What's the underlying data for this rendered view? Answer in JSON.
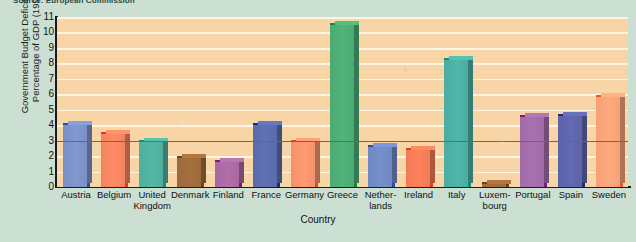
{
  "source_note": "Source: European Commission",
  "axis": {
    "y_title": "Government Budget Deficit\nas a Percentage of GDP (1996)",
    "x_title": "Country"
  },
  "chart_data": {
    "type": "bar",
    "title": "",
    "xlabel": "Country",
    "ylabel": "Government Budget Deficit as a Percentage of GDP (1996)",
    "ylim": [
      0,
      11
    ],
    "yticks": [
      0,
      1,
      2,
      3,
      4,
      5,
      6,
      7,
      8,
      9,
      10,
      11
    ],
    "grid": true,
    "legend": "none",
    "reference_line": {
      "value": 3.0,
      "color": "#e23a22",
      "label": ""
    },
    "categories": [
      "Austria",
      "Belgium",
      "United\nKingdom",
      "Denmark",
      "Finland",
      "France",
      "Germany",
      "Greece",
      "Nether-\nlands",
      "Ireland",
      "Italy",
      "Luxem-\nbourg",
      "Portugal",
      "Spain",
      "Sweden"
    ],
    "values": [
      4.0,
      3.4,
      2.9,
      1.9,
      1.6,
      4.0,
      2.9,
      10.5,
      2.6,
      2.4,
      8.2,
      0.1,
      4.5,
      4.6,
      5.8
    ],
    "bar_colors": [
      "#7b8fc4",
      "#f2835f",
      "#4fae9c",
      "#9d6a3b",
      "#a868a0",
      "#5a6bab",
      "#f2916c",
      "#4caa72",
      "#6f88c2",
      "#f07a56",
      "#4aada0",
      "#9d6a3b",
      "#a06ba6",
      "#5d63a8",
      "#f5a077"
    ],
    "bar_edge_colors": [
      "#2b4fa0",
      "#e23a22",
      "#0f8f79",
      "#6b4318",
      "#7a1d76",
      "#1b2a7a",
      "#e04a22",
      "#0f8a42",
      "#2b4fa0",
      "#e23a22",
      "#0f8f79",
      "#6b4318",
      "#7a1d76",
      "#1b2a7a",
      "#e8562a"
    ]
  },
  "colors": {
    "page_background": "#ccdfd3",
    "plot_background": "#f7d5a6",
    "gridline": "#fdf4e2",
    "axis": "#1b1b1b",
    "reference": "#e23a22"
  }
}
